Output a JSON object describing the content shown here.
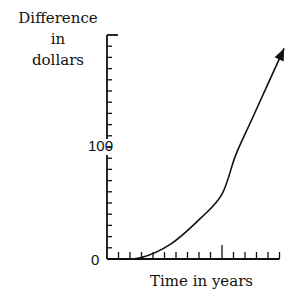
{
  "chart_data": {
    "type": "line",
    "title": "",
    "xlabel": "Time in years",
    "ylabel": "Difference in dollars",
    "ylabel_lines": [
      "Difference",
      "in",
      "dollars"
    ],
    "y_tick_labels": [
      "0",
      "100"
    ],
    "x_tick_labels": [],
    "ylim": [
      0,
      200
    ],
    "xlim": [
      0,
      15
    ],
    "y_minor_tick_step": 10,
    "x_minor_tick_step": 1,
    "x_major_tick_at": 10,
    "grid": false,
    "legend": null,
    "arrow_at_end": true,
    "series": [
      {
        "name": "Difference",
        "x": [
          0.7,
          2.9,
          5.5,
          8.1,
          10,
          11.2,
          12.7,
          15.4
        ],
        "y": [
          0,
          1,
          13,
          36,
          58,
          93,
          127,
          188
        ]
      }
    ]
  }
}
